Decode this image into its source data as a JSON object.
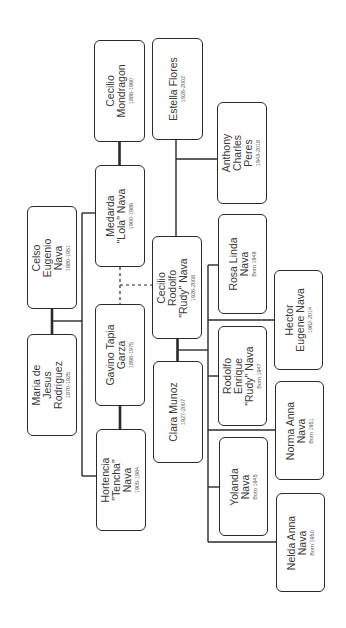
{
  "diagram": {
    "type": "family-tree",
    "orientation": "rotated-90-ccw",
    "colors": {
      "background": "#ffffff",
      "border": "#2a2a2a",
      "text": "#3a3a3a",
      "line": "#2a2a2a"
    }
  },
  "people": [
    {
      "id": "cecilio-mondragon",
      "name_lines": [
        "Cecilio",
        "Mondragon"
      ],
      "dates": "1886-1960",
      "box": [
        94,
        40,
        51,
        102
      ]
    },
    {
      "id": "estella-flores",
      "name_lines": [
        "Estella Flores"
      ],
      "dates": "1926-2002",
      "box": [
        152,
        38,
        51,
        102
      ]
    },
    {
      "id": "anthony-charles-peres",
      "name_lines": [
        "Anthony",
        "Charles",
        "Peres"
      ],
      "dates": "1943-2018",
      "box": [
        217,
        102,
        50,
        102
      ]
    },
    {
      "id": "celso-eugenio-nava",
      "name_lines": [
        "Celso",
        "Eugenio",
        "Nava"
      ],
      "dates": "1880-1951",
      "box": [
        27,
        206,
        50,
        103
      ]
    },
    {
      "id": "medarda-lola-nava",
      "name_lines": [
        "Medarda",
        "\"Lola\" Nava"
      ],
      "dates": "1900-1986",
      "box": [
        95,
        165,
        50,
        102
      ]
    },
    {
      "id": "cecilio-rodolfo-rudy-nava",
      "name_lines": [
        "Cecilio",
        "Rodolfo",
        "\"Rudy\" Nava"
      ],
      "dates": "1926-2008",
      "box": [
        152,
        236,
        50,
        103
      ]
    },
    {
      "id": "rosa-linda-nava",
      "name_lines": [
        "Rosa Linda",
        "Nava"
      ],
      "dates": "Born 1948",
      "box": [
        218,
        214,
        49,
        100
      ]
    },
    {
      "id": "hector-eugene-nava",
      "name_lines": [
        "Hector",
        "Eugene Nava"
      ],
      "dates": "1962-2014",
      "box": [
        274,
        270,
        49,
        100
      ]
    },
    {
      "id": "maria-de-jesus-rodriguez",
      "name_lines": [
        "Maria de",
        "Jesus",
        "Rodriguez"
      ],
      "dates": "1870-1925",
      "box": [
        27,
        334,
        50,
        102
      ]
    },
    {
      "id": "gavino-tapia-garza",
      "name_lines": [
        "Gavino Tapia",
        "Garza"
      ],
      "dates": "1898-1975",
      "box": [
        95,
        304,
        50,
        102
      ]
    },
    {
      "id": "clara-munoz",
      "name_lines": [
        "Clara Munoz"
      ],
      "dates": "1927-2007",
      "box": [
        153,
        361,
        50,
        102
      ]
    },
    {
      "id": "rodolfo-enrique-rudy-nava",
      "name_lines": [
        "Rodolfo",
        "Enrique",
        "\"Rudy\" Nava"
      ],
      "dates": "Born 1947",
      "box": [
        218,
        326,
        49,
        100
      ]
    },
    {
      "id": "norma-anna-nava",
      "name_lines": [
        "Norma Anna",
        "Nava"
      ],
      "dates": "Born 1951",
      "box": [
        275,
        381,
        49,
        99
      ]
    },
    {
      "id": "hortencia-tencha-nava",
      "name_lines": [
        "Hortencia",
        "\"Tencha\"",
        "Nava"
      ],
      "dates": "1905-1984",
      "box": [
        96,
        429,
        50,
        102
      ]
    },
    {
      "id": "yolanda-nava",
      "name_lines": [
        "Yolanda",
        "Nava"
      ],
      "dates": "Born 1945",
      "box": [
        219,
        437,
        49,
        99
      ]
    },
    {
      "id": "nelda-anna-nava",
      "name_lines": [
        "Nelda Anna",
        "Nava"
      ],
      "dates": "Born 1950",
      "box": [
        276,
        493,
        49,
        99
      ]
    }
  ],
  "relationships": [
    {
      "type": "spouse",
      "a": "cecilio-mondragon",
      "b": "medarda-lola-nava"
    },
    {
      "type": "spouse",
      "a": "celso-eugenio-nava",
      "b": "maria-de-jesus-rodriguez"
    },
    {
      "type": "spouse",
      "a": "gavino-tapia-garza",
      "b": "hortencia-tencha-nava"
    },
    {
      "type": "spouse",
      "a": "cecilio-rodolfo-rudy-nava",
      "b": "clara-munoz"
    },
    {
      "type": "partner",
      "a": "estella-flores",
      "b": "cecilio-rodolfo-rudy-nava"
    },
    {
      "type": "child",
      "parents": [
        "celso-eugenio-nava",
        "maria-de-jesus-rodriguez"
      ],
      "children": [
        "medarda-lola-nava",
        "hortencia-tencha-nava"
      ]
    },
    {
      "type": "child-dashed",
      "parents": [
        "medarda-lola-nava",
        "gavino-tapia-garza"
      ],
      "children": [
        "cecilio-rodolfo-rudy-nava"
      ]
    },
    {
      "type": "child",
      "parents": [
        "estella-flores",
        "cecilio-rodolfo-rudy-nava"
      ],
      "children": [
        "anthony-charles-peres"
      ]
    },
    {
      "type": "child",
      "parents": [
        "cecilio-rodolfo-rudy-nava",
        "clara-munoz"
      ],
      "children": [
        "rosa-linda-nava",
        "hector-eugene-nava",
        "rodolfo-enrique-rudy-nava",
        "norma-anna-nava",
        "yolanda-nava",
        "nelda-anna-nava"
      ]
    }
  ]
}
